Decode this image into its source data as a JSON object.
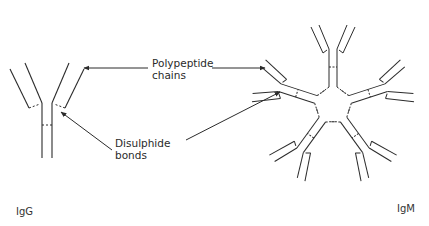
{
  "diagram": {
    "labels": {
      "polypeptide": [
        "Polypeptide",
        "chains"
      ],
      "disulphide": [
        "Disulphide",
        "bonds"
      ]
    },
    "captions": {
      "igg": "IgG",
      "igm": "IgM"
    },
    "colors": {
      "line": "#2b2b2b",
      "background": "#ffffff"
    },
    "structures": [
      {
        "name": "IgG",
        "type": "monomer",
        "arms": 2
      },
      {
        "name": "IgM",
        "type": "pentamer",
        "monomers": 5
      }
    ]
  }
}
